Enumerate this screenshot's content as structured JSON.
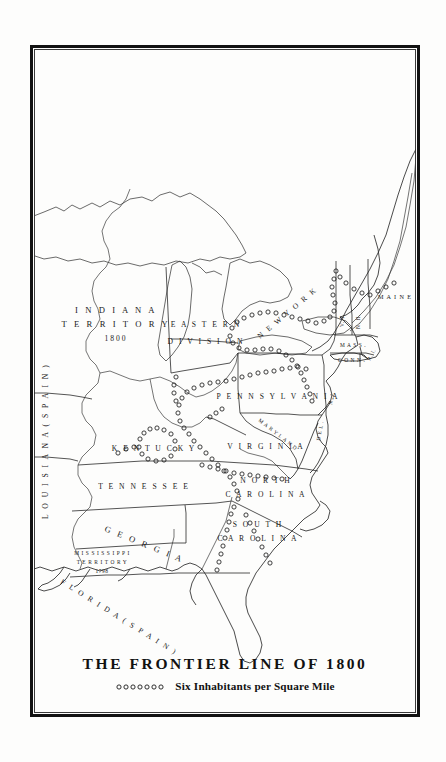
{
  "figure": {
    "title": "THE FRONTIER LINE OF 1800",
    "legend": {
      "symbol": "open-circle-chain",
      "symbol_count": 7,
      "label": "Six Inhabitants per Square Mile"
    },
    "frame": {
      "style": "double-rule",
      "outer_color": "#121212",
      "inner_color": "#3a3a3a"
    },
    "background_color": "#fdfdfc",
    "ink_color": "#1a1a1a"
  },
  "map": {
    "type": "historical-political-map",
    "region": "Eastern United States",
    "year": 1800,
    "labels": [
      {
        "id": "louisiana",
        "text": "L O U I S I A N A   ( S P A I N )",
        "orientation": "vertical-up"
      },
      {
        "id": "indiana-territory",
        "line1": "I N D I A N A",
        "line2": "T E R R I T O R Y",
        "line3": "1800"
      },
      {
        "id": "eastern-division",
        "line1": "E A S T E R N",
        "line2": "D I V I S I O N"
      },
      {
        "id": "pennsylvania",
        "text": "P E N N S Y L V A N I A"
      },
      {
        "id": "new-york",
        "text": "N E W   Y O R K",
        "orientation": "rotated"
      },
      {
        "id": "maine",
        "text": "M A I N E"
      },
      {
        "id": "vermont",
        "text": "V. T.",
        "orientation": "vertical"
      },
      {
        "id": "new-hampshire",
        "text": "N. H.",
        "orientation": "vertical"
      },
      {
        "id": "massachusetts",
        "text": "M A S S ."
      },
      {
        "id": "connecticut",
        "text": "C O N N ."
      },
      {
        "id": "rhode-island",
        "text": "R. I.",
        "orientation": "rotated"
      },
      {
        "id": "new-jersey",
        "text": "N. J.",
        "orientation": "vertical"
      },
      {
        "id": "delaware",
        "text": "D E L .",
        "orientation": "vertical"
      },
      {
        "id": "maryland",
        "text": "M A R Y L A N D",
        "orientation": "curved"
      },
      {
        "id": "virginia",
        "text": "V I R G I N I A"
      },
      {
        "id": "kentucky",
        "text": "K E N T U C K Y"
      },
      {
        "id": "tennessee",
        "text": "T E N N E S S E E"
      },
      {
        "id": "north-carolina",
        "line1": "N O R T H",
        "line2": "C A R O L I N A"
      },
      {
        "id": "south-carolina",
        "line1": "S O U T H",
        "line2": "C A R O L I N A"
      },
      {
        "id": "georgia",
        "text": "G E O R G I A",
        "orientation": "curved"
      },
      {
        "id": "mississippi-territory",
        "line1": "M I S S I S S I P P I",
        "line2": "T E R R I T O R Y",
        "line3": "1798"
      },
      {
        "id": "florida",
        "text": "F L O R I D A   ( S P A I N )",
        "orientation": "curved"
      }
    ],
    "features": {
      "great_lakes": [
        "Lake Superior",
        "Lake Michigan",
        "Lake Huron",
        "Lake Erie",
        "Lake Ontario"
      ],
      "frontier_line_symbol": "chain of small open circles",
      "frontier_line_meaning": "Six Inhabitants per Square Mile"
    }
  }
}
